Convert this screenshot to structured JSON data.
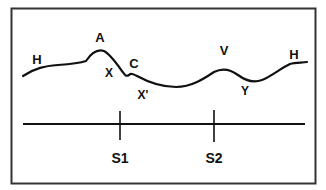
{
  "diagram": {
    "colors": {
      "stroke": "#111111",
      "background": "#ffffff",
      "frame": "#333333"
    },
    "wave_labels": [
      {
        "id": "H_left",
        "text": "H",
        "x": 37,
        "y": 64,
        "size": 13
      },
      {
        "id": "A",
        "text": "A",
        "x": 100,
        "y": 42,
        "size": 13
      },
      {
        "id": "X",
        "text": "X",
        "x": 109,
        "y": 77,
        "size": 12
      },
      {
        "id": "C",
        "text": "C",
        "x": 134,
        "y": 68,
        "size": 13
      },
      {
        "id": "X_prime",
        "text": "X'",
        "x": 143,
        "y": 99,
        "size": 12
      },
      {
        "id": "V",
        "text": "V",
        "x": 224,
        "y": 55,
        "size": 13
      },
      {
        "id": "Y",
        "text": "Y",
        "x": 245,
        "y": 95,
        "size": 12
      },
      {
        "id": "H_right",
        "text": "H",
        "x": 294,
        "y": 59,
        "size": 13
      }
    ],
    "axis_labels": [
      {
        "id": "S1",
        "text": "S1",
        "x": 120,
        "y": 163,
        "size": 14
      },
      {
        "id": "S2",
        "text": "S2",
        "x": 214,
        "y": 163,
        "size": 14
      }
    ]
  }
}
